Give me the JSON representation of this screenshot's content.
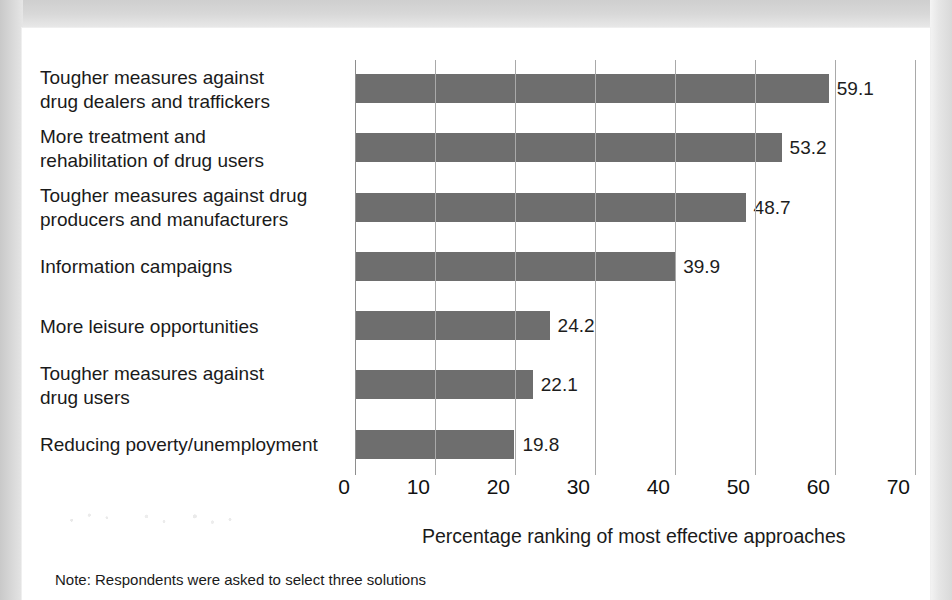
{
  "chart_data": {
    "type": "bar",
    "orientation": "horizontal",
    "title": "",
    "xlabel": "Percentage ranking of most effective approaches",
    "ylabel": "",
    "xlim": [
      0,
      70
    ],
    "xticks": [
      0,
      10,
      20,
      30,
      40,
      50,
      60,
      70
    ],
    "xtick_labels": [
      "0",
      "10",
      "20",
      "30",
      "40",
      "50",
      "60",
      "70"
    ],
    "grid": "vertical",
    "legend": "none",
    "bar_color": "#6e6e6e",
    "categories": [
      "Tougher measures against drug dealers and traffickers",
      "More treatment and rehabilitation of drug users",
      "Tougher measures against drug producers and manufacturers",
      "Information campaigns",
      "More leisure opportunities",
      "Tougher measures against drug users",
      "Reducing poverty/unemployment"
    ],
    "values": [
      59.1,
      53.2,
      48.7,
      39.9,
      24.2,
      22.1,
      19.8
    ],
    "value_labels": [
      "59.1",
      "53.2",
      "48.7",
      "39.9",
      "24.2",
      "22.1",
      "19.8"
    ],
    "category_lines": [
      [
        "Tougher measures against",
        "drug dealers and traffickers"
      ],
      [
        "More treatment and",
        "rehabilitation of drug users"
      ],
      [
        "Tougher measures against drug",
        "producers and manufacturers"
      ],
      [
        "Information campaigns"
      ],
      [
        "More leisure opportunities"
      ],
      [
        "Tougher measures against",
        "drug users"
      ],
      [
        "Reducing poverty/unemployment"
      ]
    ],
    "annotations": [
      "Note: Respondents were asked to select three solutions"
    ]
  },
  "footer": {
    "note": "Note: Respondents were asked to select three solutions"
  },
  "axis": {
    "title": "Percentage ranking of most effective approaches"
  }
}
